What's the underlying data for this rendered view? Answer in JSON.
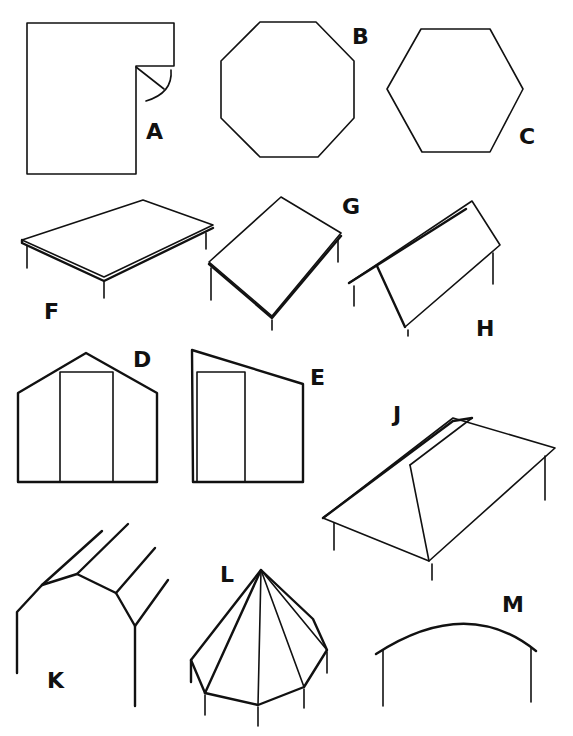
{
  "figure": {
    "ink_color": "#111111",
    "background_color": "#ffffff"
  },
  "labels": {
    "A": "A",
    "B": "B",
    "C": "C",
    "D": "D",
    "E": "E",
    "F": "F",
    "G": "G",
    "H": "H",
    "J": "J",
    "K": "K",
    "L": "L",
    "M": "M"
  },
  "shapes": [
    {
      "id": "A",
      "kind": "L-shaped floor plan with door swing"
    },
    {
      "id": "B",
      "kind": "octagonal floor plan"
    },
    {
      "id": "C",
      "kind": "hexagonal floor plan"
    },
    {
      "id": "D",
      "kind": "gable end wall elevation with door"
    },
    {
      "id": "E",
      "kind": "lean-to end wall elevation with door"
    },
    {
      "id": "F",
      "kind": "flat roof"
    },
    {
      "id": "G",
      "kind": "single-pitch (lean-to) roof"
    },
    {
      "id": "H",
      "kind": "gable (pitched) roof"
    },
    {
      "id": "J",
      "kind": "hipped roof"
    },
    {
      "id": "K",
      "kind": "gambrel / mansard roof frame"
    },
    {
      "id": "L",
      "kind": "octagonal pyramid roof"
    },
    {
      "id": "M",
      "kind": "curved (arched) roof"
    }
  ]
}
